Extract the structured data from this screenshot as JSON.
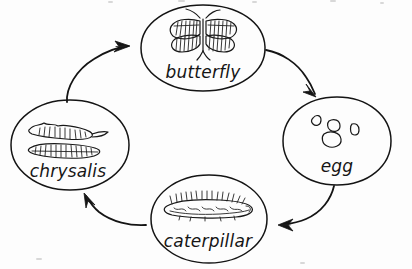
{
  "diagram": {
    "type": "cycle-diagram",
    "direction": "clockwise",
    "style": "hand-drawn pencil sketch on white paper",
    "ink_color": "#141414",
    "background_color": "#fdfdfd",
    "nodes": [
      {
        "id": "butterfly",
        "label": "butterfly",
        "position": "top",
        "cx": 203,
        "cy": 48,
        "rx": 62,
        "ry": 43,
        "sketch": "butterfly with four hatched wings, body and two antennae"
      },
      {
        "id": "egg",
        "label": "egg",
        "position": "right",
        "cx": 337,
        "cy": 141,
        "rx": 55,
        "ry": 44,
        "sketch": "four small oval eggs"
      },
      {
        "id": "caterpillar",
        "label": "caterpillar",
        "position": "bottom",
        "cx": 209,
        "cy": 219,
        "rx": 58,
        "ry": 44,
        "sketch": "hairy segmented caterpillar with bristles along the back"
      },
      {
        "id": "chrysalis",
        "label": "chrysalis",
        "position": "left",
        "cx": 70,
        "cy": 145,
        "rx": 59,
        "ry": 45,
        "sketch": "two horizontal hatched pupa shapes"
      }
    ],
    "arrows": [
      {
        "id": "butterfly-to-egg",
        "from": "butterfly",
        "to": "egg",
        "label": "",
        "curve": "arcs down and right"
      },
      {
        "id": "egg-to-caterpillar",
        "from": "egg",
        "to": "caterpillar",
        "label": "",
        "curve": "arcs down and left"
      },
      {
        "id": "caterpillar-to-chrysalis",
        "from": "caterpillar",
        "to": "chrysalis",
        "label": "",
        "curve": "arcs up and left"
      },
      {
        "id": "chrysalis-to-butterfly",
        "from": "chrysalis",
        "to": "butterfly",
        "label": "",
        "curve": "arcs up and right"
      }
    ]
  }
}
